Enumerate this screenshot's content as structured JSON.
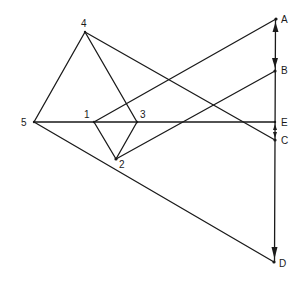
{
  "diagram": {
    "type": "geometric-vector-diagram",
    "points": {
      "A": {
        "x": 276,
        "y": 19,
        "label": "A"
      },
      "B": {
        "x": 275,
        "y": 71,
        "label": "B"
      },
      "E": {
        "x": 275,
        "y": 122,
        "label": "E"
      },
      "C": {
        "x": 275,
        "y": 140,
        "label": "C"
      },
      "D": {
        "x": 274,
        "y": 262,
        "label": "D"
      },
      "p1": {
        "x": 94,
        "y": 122,
        "label": "1"
      },
      "p2": {
        "x": 116,
        "y": 159,
        "label": "2"
      },
      "p3": {
        "x": 137,
        "y": 122,
        "label": "3"
      },
      "p4": {
        "x": 85,
        "y": 32,
        "label": "4"
      },
      "p5": {
        "x": 34,
        "y": 122,
        "label": "5"
      }
    },
    "edges": [
      [
        "p4",
        "p5"
      ],
      [
        "p4",
        "p3"
      ],
      [
        "p4",
        "C"
      ],
      [
        "p5",
        "E"
      ],
      [
        "p5",
        "D"
      ],
      [
        "p1",
        "A"
      ],
      [
        "p1",
        "p2"
      ],
      [
        "p3",
        "p2"
      ],
      [
        "p2",
        "B"
      ],
      [
        "A",
        "D"
      ]
    ],
    "arrows": [
      {
        "at": "A",
        "direction": "up"
      },
      {
        "at": "B",
        "direction": "down"
      },
      {
        "at": "E",
        "direction": "up"
      },
      {
        "at": "C",
        "direction": "down"
      },
      {
        "at": "D",
        "direction": "down"
      }
    ]
  }
}
